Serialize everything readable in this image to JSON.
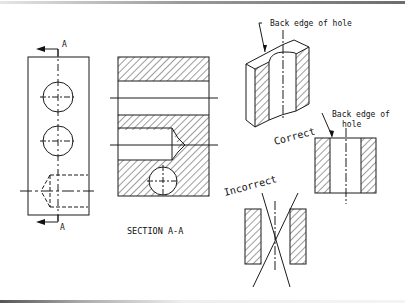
{
  "figure": {
    "front_view": {
      "cut_label_top": "A",
      "cut_label_bottom": "A"
    },
    "section_view": {
      "caption": "SECTION A-A"
    },
    "isometric_view": {
      "callout": "Back edge of hole"
    },
    "correct_view": {
      "label": "Correct",
      "callout_line1": "Back edge of",
      "callout_line2": "hole"
    },
    "incorrect_view": {
      "label": "Incorrect"
    }
  },
  "colors": {
    "line": "#1a1a1a",
    "background": "#ffffff"
  }
}
